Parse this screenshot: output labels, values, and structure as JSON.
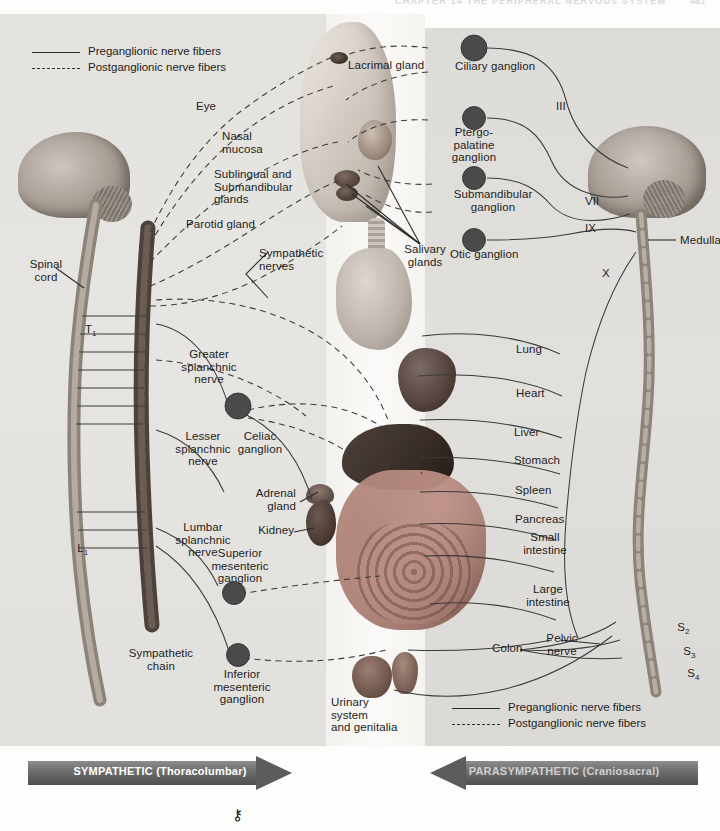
{
  "page": {
    "header_text": "CHAPTER 14  THE PERIPHERAL NERVOUS SYSTEM",
    "header_number": "461",
    "key_symbol": "⚷"
  },
  "legend_top": {
    "items": [
      {
        "style": "solid",
        "label": "Preganglionic nerve fibers"
      },
      {
        "style": "dashed",
        "label": "Postganglionic nerve fibers"
      }
    ]
  },
  "legend_bottom": {
    "items": [
      {
        "style": "solid",
        "label": "Preganglionic nerve fibers"
      },
      {
        "style": "dashed",
        "label": "Postganglionic nerve fibers"
      }
    ]
  },
  "arrows": {
    "sympathetic": "SYMPATHETIC (Thoracolumbar)",
    "parasympathetic": "PARASYMPATHETIC (Craniosacral)"
  },
  "left_labels": {
    "eye": "Eye",
    "nasal_mucosa": "Nasal\nmucosa",
    "sublingual_submandibular": "Sublingual and\nSubmandibular\nglands",
    "parotid_gland": "Parotid gland",
    "sympathetic_nerves": "Sympathetic\nnerves",
    "spinal_cord": "Spinal\ncord",
    "thoracic_level": "T",
    "thoracic_level_sub": "1",
    "lumbar_level": "L",
    "lumbar_level_sub": "1",
    "greater_splanchnic": "Greater\nsplanchnic\nnerve",
    "lesser_splanchnic": "Lesser\nsplanchnic\nnerve",
    "lumbar_splanchnic": "Lumbar\nsplanchnic\nnerve",
    "celiac_ganglion": "Celiac\nganglion",
    "adrenal_gland": "Adrenal\ngland",
    "kidney": "Kidney",
    "superior_mesenteric": "Superior\nmesenteric\nganglion",
    "inferior_mesenteric": "Inferior\nmesenteric\nganglion",
    "sympathetic_chain": "Sympathetic\nchain"
  },
  "center_labels": {
    "lacrimal_gland": "Lacrimal gland",
    "salivary_glands": "Salivary\nglands",
    "urinary_system": "Urinary\nsystem\nand genitalia"
  },
  "right_labels": {
    "ciliary_ganglion": "Ciliary ganglion",
    "pterygopalatine_ganglion": "Ptergo-\npalatine\nganglion",
    "submandibular_ganglion": "Submandibular\nganglion",
    "otic_ganglion": "Otic ganglion",
    "medulla": "Medulla",
    "organs": [
      "Lung",
      "Heart",
      "Liver",
      "Stomach",
      "Spleen",
      "Pancreas",
      "Small\nintestine",
      "Large\nintestine",
      "Colon"
    ],
    "pelvic_nerve": "Pelvic\nnerve"
  },
  "cranial_nerves": [
    {
      "id": "III"
    },
    {
      "id": "VII"
    },
    {
      "id": "IX"
    },
    {
      "id": "X"
    }
  ],
  "sacral_levels": [
    {
      "root": "S",
      "sub": "2"
    },
    {
      "root": "S",
      "sub": "3"
    },
    {
      "root": "S",
      "sub": "4"
    }
  ],
  "colors": {
    "panel_left": "#e4e3df",
    "panel_right": "#dedcd8",
    "nerve_line": "#3a3a3a",
    "ganglion": "#4a4a4a",
    "arrow_bar": "#6f6f6f",
    "text": "#1d1d1d"
  }
}
